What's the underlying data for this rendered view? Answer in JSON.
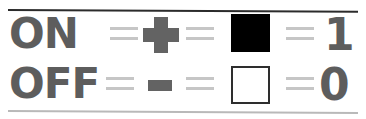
{
  "figure": {
    "name": "on-off-binary-legend",
    "background_color": "#ffffff",
    "rules": {
      "top_color": "#2b2b2b",
      "bottom_color": "#b9b9b9"
    }
  },
  "palette": {
    "text_gray": "#5d5d5d",
    "symbol_gray": "#636363",
    "equals_gray": "#c6c6c6",
    "filled_square": "#000000",
    "empty_square_fill": "#ffffff",
    "empty_square_border": "#2e2e2e"
  },
  "rows": [
    {
      "state_label": "ON",
      "equals_1": "=",
      "symbol": "+",
      "symbol_name": "plus-sign",
      "equals_2": "=",
      "swatch_name": "filled-square",
      "equals_3": "=",
      "digit": "1"
    },
    {
      "state_label": "OFF",
      "equals_1": "=",
      "symbol": "-",
      "symbol_name": "minus-sign",
      "equals_2": "=",
      "swatch_name": "empty-square",
      "equals_3": "=",
      "digit": "0"
    }
  ]
}
